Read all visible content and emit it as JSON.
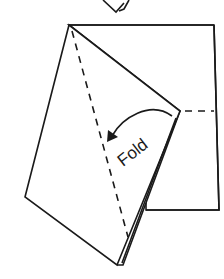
{
  "diagram": {
    "type": "paper-folding-instruction",
    "label": "Fold",
    "colors": {
      "line": "#1a1a1a",
      "paper": "#ffffff",
      "background": "#ffffff"
    },
    "elements": {
      "previous_step_fragment": "partially visible folded paper corner at top",
      "back_sheet": "square sheet behind",
      "front_flap": "folded flap in front",
      "fold_line": "dashed valley fold line",
      "reference_line": "dashed horizontal guide line",
      "arrow": "curved fold-direction arrow"
    }
  }
}
